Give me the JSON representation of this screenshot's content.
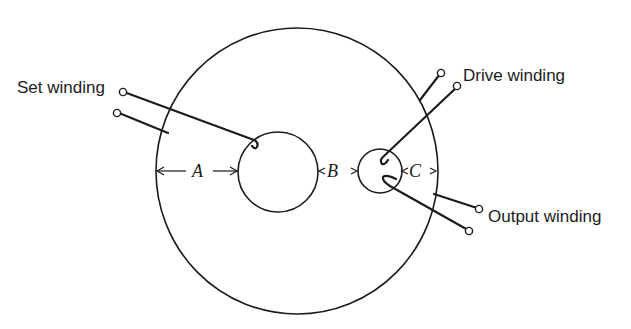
{
  "diagram": {
    "labels": {
      "set_winding": "Set winding",
      "drive_winding": "Drive winding",
      "output_winding": "Output winding"
    },
    "dimensions": {
      "a": "A",
      "b": "B",
      "c": "C"
    },
    "colors": {
      "ink": "#1c1c1c",
      "background": "#ffffff"
    }
  }
}
